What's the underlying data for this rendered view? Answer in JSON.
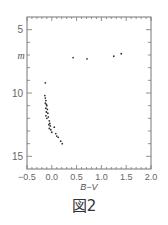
{
  "figure": {
    "caption": "図2"
  },
  "chart_data": {
    "type": "scatter",
    "title": "",
    "xlabel": "B−V",
    "ylabel": "m",
    "xlim": [
      -0.5,
      2.0
    ],
    "ylim": [
      16.0,
      4.0
    ],
    "y_inverted": true,
    "x_ticks": [
      -0.5,
      0.0,
      0.5,
      1.0,
      1.5,
      2.0
    ],
    "x_tick_labels": [
      "−0.5",
      "0.0",
      "0.5",
      "1.0",
      "1.5",
      "2.0"
    ],
    "y_ticks": [
      5,
      10,
      15
    ],
    "y_tick_labels": [
      "5",
      "10",
      "15"
    ],
    "grid": false,
    "legend": null,
    "series": [
      {
        "name": "giants",
        "points": [
          {
            "x": 0.43,
            "y": 7.2
          },
          {
            "x": 0.71,
            "y": 7.3
          },
          {
            "x": 1.25,
            "y": 7.1
          },
          {
            "x": 1.4,
            "y": 6.9
          }
        ]
      },
      {
        "name": "main-sequence",
        "points": [
          {
            "x": -0.13,
            "y": 9.2
          },
          {
            "x": -0.14,
            "y": 10.2
          },
          {
            "x": -0.13,
            "y": 10.4
          },
          {
            "x": -0.12,
            "y": 10.6
          },
          {
            "x": -0.13,
            "y": 10.8
          },
          {
            "x": -0.11,
            "y": 10.9
          },
          {
            "x": -0.1,
            "y": 11.0
          },
          {
            "x": -0.12,
            "y": 11.2
          },
          {
            "x": -0.09,
            "y": 11.3
          },
          {
            "x": -0.11,
            "y": 11.5
          },
          {
            "x": -0.08,
            "y": 11.6
          },
          {
            "x": -0.12,
            "y": 11.8
          },
          {
            "x": -0.07,
            "y": 11.9
          },
          {
            "x": -0.1,
            "y": 12.0
          },
          {
            "x": -0.05,
            "y": 12.2
          },
          {
            "x": -0.04,
            "y": 12.4
          },
          {
            "x": -0.06,
            "y": 12.5
          },
          {
            "x": -0.03,
            "y": 12.6
          },
          {
            "x": -0.05,
            "y": 12.8
          },
          {
            "x": -0.02,
            "y": 12.9
          },
          {
            "x": 0.05,
            "y": 12.7
          },
          {
            "x": 0.0,
            "y": 13.1
          },
          {
            "x": 0.08,
            "y": 13.2
          },
          {
            "x": 0.1,
            "y": 13.4
          },
          {
            "x": 0.13,
            "y": 13.5
          },
          {
            "x": 0.18,
            "y": 13.8
          },
          {
            "x": 0.21,
            "y": 14.0
          }
        ]
      }
    ]
  }
}
